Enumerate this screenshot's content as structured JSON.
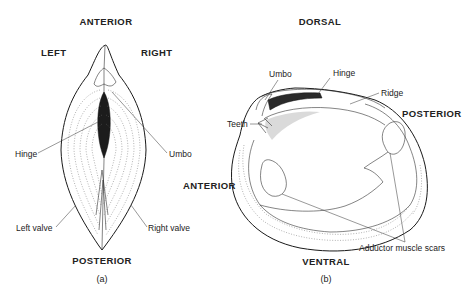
{
  "figure_a": {
    "caption": "(a)",
    "orientation_labels": {
      "top": "ANTERIOR",
      "left": "LEFT",
      "right": "RIGHT",
      "bottom": "POSTERIOR"
    },
    "part_labels": {
      "hinge": "Hinge",
      "umbo": "Umbo",
      "left_valve": "Left valve",
      "right_valve": "Right valve"
    }
  },
  "figure_b": {
    "caption": "(b)",
    "orientation_labels": {
      "top": "DORSAL",
      "left": "ANTERIOR",
      "right": "POSTERIOR",
      "bottom": "VENTRAL"
    },
    "part_labels": {
      "umbo": "Umbo",
      "hinge": "Hinge",
      "ridge": "Ridge",
      "teeth": "Teeth",
      "adductor_muscle_scars": "Adductor muscle scars"
    }
  },
  "colors": {
    "ink": "#1a1a1a",
    "background": "#ffffff"
  }
}
